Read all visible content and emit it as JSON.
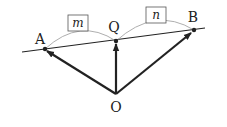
{
  "diagram": {
    "points": {
      "A": {
        "label": "A",
        "x": 45,
        "y": 49
      },
      "Q": {
        "label": "Q",
        "x": 116,
        "y": 41
      },
      "B": {
        "label": "B",
        "x": 194,
        "y": 30
      },
      "O": {
        "label": "O",
        "x": 116,
        "y": 94
      }
    },
    "line": {
      "x1": 22,
      "y1": 52,
      "x2": 205,
      "y2": 28
    },
    "vectors": [
      {
        "from": "O",
        "to": "A"
      },
      {
        "from": "O",
        "to": "Q"
      },
      {
        "from": "O",
        "to": "B"
      }
    ],
    "ratios": {
      "m": {
        "label": "m",
        "between": [
          "A",
          "Q"
        ]
      },
      "n": {
        "label": "n",
        "between": [
          "Q",
          "B"
        ]
      }
    },
    "colors": {
      "stroke": "#222222",
      "arc": "#999999",
      "box_border": "#555555",
      "background": "#ffffff"
    }
  }
}
